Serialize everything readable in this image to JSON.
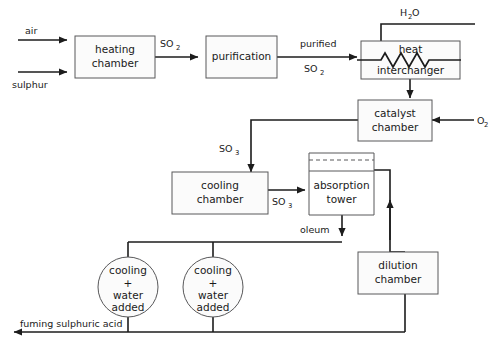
{
  "diagram": {
    "type": "process-flow-diagram",
    "colors": {
      "line": "#1c1c1c",
      "box_stroke": "#58585a",
      "box_fill": "#fbfbfb",
      "background": "#ffffff",
      "text": "#1a1a1a"
    },
    "nodes": [
      {
        "id": "heating-chamber",
        "shape": "rect",
        "line1": "heating",
        "line2": "chamber"
      },
      {
        "id": "purification",
        "shape": "rect",
        "line1": "purification",
        "line2": ""
      },
      {
        "id": "heat-interchanger",
        "shape": "rect",
        "line1": "heat",
        "line2": "interchanger"
      },
      {
        "id": "catalyst-chamber",
        "shape": "rect",
        "line1": "catalyst",
        "line2": "chamber"
      },
      {
        "id": "cooling-chamber",
        "shape": "rect",
        "line1": "cooling",
        "line2": "chamber"
      },
      {
        "id": "absorption-tower",
        "shape": "rect",
        "line1": "absorption",
        "line2": "tower"
      },
      {
        "id": "dilution-chamber",
        "shape": "rect",
        "line1": "dilution",
        "line2": "chamber"
      },
      {
        "id": "cooling-water-1",
        "shape": "circle",
        "line1": "cooling",
        "line2": "+",
        "line3": "water",
        "line4": "added"
      },
      {
        "id": "cooling-water-2",
        "shape": "circle",
        "line1": "cooling",
        "line2": "+",
        "line3": "water",
        "line4": "added"
      }
    ],
    "stream_labels": {
      "air": "air",
      "sulphur": "sulphur",
      "so2_a": "SO",
      "so2_a_sub": "2",
      "purified": "purified",
      "so2_b": "SO",
      "so2_b_sub": "2",
      "water": "H",
      "water_sub": "2",
      "water_tail": "O",
      "oxygen": "O",
      "oxygen_sub": "2",
      "so3_a": "SO",
      "so3_a_sub": "3",
      "so3_b": "SO",
      "so3_b_sub": "3",
      "oleum": "oleum",
      "product": "fuming sulphuric acid"
    },
    "node_labels": {
      "heating_l1": "heating",
      "heating_l2": "chamber",
      "purification": "purification",
      "heat_l1": "heat",
      "heat_l2": "interchanger",
      "catalyst_l1": "catalyst",
      "catalyst_l2": "chamber",
      "cooling_l1": "cooling",
      "cooling_l2": "chamber",
      "absorption_l1": "absorption",
      "absorption_l2": "tower",
      "dilution_l1": "dilution",
      "dilution_l2": "chamber",
      "circle_l1": "cooling",
      "circle_l2": "+",
      "circle_l3": "water",
      "circle_l4": "added"
    }
  }
}
